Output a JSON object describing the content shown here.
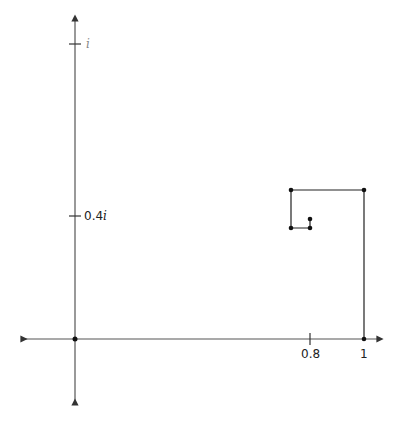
{
  "diagram": {
    "type": "complex-plane spiral path",
    "axes": {
      "real_ticks": [
        {
          "value": 0.8,
          "label": "0.8"
        },
        {
          "value": 1,
          "label": "1"
        }
      ],
      "imag_ticks": [
        {
          "value": 0.4,
          "label_num": "0.4",
          "label_i": "i"
        },
        {
          "value": 1,
          "label_num": "",
          "label_i": "i"
        }
      ]
    },
    "path_points": [
      {
        "re": 1.0,
        "im": 0.0
      },
      {
        "re": 1.0,
        "im": 0.487
      },
      {
        "re": 0.747,
        "im": 0.487
      },
      {
        "re": 0.747,
        "im": 0.363
      },
      {
        "re": 0.813,
        "im": 0.363
      },
      {
        "re": 0.813,
        "im": 0.392
      }
    ],
    "colors": {
      "line": "#222222",
      "axis": "#333333",
      "point": "#111111"
    }
  }
}
